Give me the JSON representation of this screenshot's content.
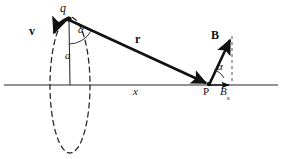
{
  "figure": {
    "background_color": "#ffffff",
    "ink_color": "#111111",
    "axis_color": "#6e6e6e",
    "labels": {
      "charge": "q",
      "velocity": "v",
      "angle_at_charge": "α",
      "radius_distance": "a",
      "position_vector": "r",
      "axis": "x",
      "field_vector": "B",
      "angle_at_point": "α",
      "field_point": "P",
      "field_x_component_base": "B",
      "field_x_component_sub": "x"
    },
    "geometry": {
      "charge_point": [
        66,
        18
      ],
      "field_point": [
        209,
        85
      ],
      "axis_y": 85,
      "axis_x_start": 4,
      "axis_x_end": 278,
      "orbit_center": [
        70,
        85
      ],
      "orbit_rx": 20,
      "orbit_ry": 68,
      "velocity_tip": [
        54,
        41
      ],
      "field_tip": [
        232,
        38
      ],
      "field_x_tip": [
        231,
        85
      ]
    }
  }
}
